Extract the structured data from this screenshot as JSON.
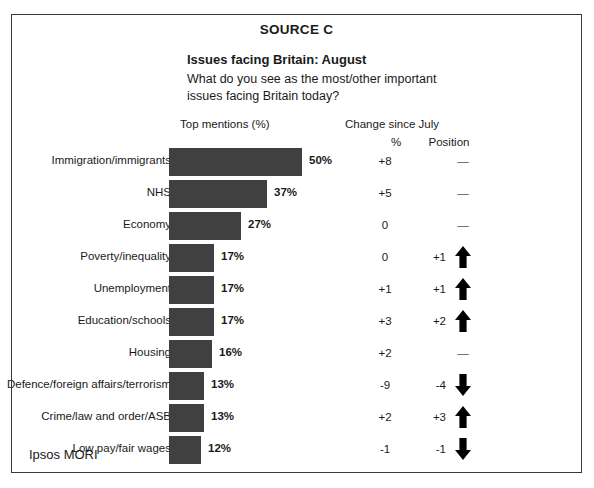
{
  "source_title": "SOURCE C",
  "chart_title": "Issues facing Britain: August",
  "chart_question": "What do you see as the most/other important issues facing Britain today?",
  "columns": {
    "bars_header": "Top mentions (%)",
    "change_group_header": "Change since July",
    "change_pct_header": "%",
    "change_position_header": "Position"
  },
  "footer": {
    "brand": "Ipsos MORI"
  },
  "colors": {
    "bar": "#404040",
    "frame": "#3a3a3a",
    "text": "#1a1a1a"
  },
  "no_change_symbol": "—",
  "chart_data": {
    "type": "bar",
    "orientation": "horizontal",
    "title": "Issues facing Britain: August",
    "subtitle": "What do you see as the most/other important issues facing Britain today?",
    "xlabel": "Top mentions (%)",
    "ylabel": "",
    "xlim": [
      0,
      50
    ],
    "grid": false,
    "legend": false,
    "categories": [
      "Immigration/immigrants",
      "NHS",
      "Economy",
      "Poverty/inequality",
      "Unemployment",
      "Education/schools",
      "Housing",
      "Defence/foreign affairs/terrorism",
      "Crime/law and order/ASB",
      "Low pay/fair wages"
    ],
    "values": [
      50,
      37,
      27,
      17,
      17,
      17,
      16,
      13,
      13,
      12
    ],
    "value_labels": [
      "50%",
      "37%",
      "27%",
      "17%",
      "17%",
      "17%",
      "16%",
      "13%",
      "13%",
      "12%"
    ],
    "change_pct": [
      "+8",
      "+5",
      "0",
      "0",
      "+1",
      "+3",
      "+2",
      "-9",
      "+2",
      "-1"
    ],
    "change_position": [
      "—",
      "—",
      "—",
      "+1",
      "+1",
      "+2",
      "—",
      "-4",
      "+3",
      "-1"
    ],
    "change_direction": [
      "none",
      "none",
      "none",
      "up",
      "up",
      "up",
      "none",
      "down",
      "up",
      "down"
    ]
  },
  "rows": [
    {
      "label": "Immigration/immigrants",
      "value": 50,
      "value_label": "50%",
      "change_pct": "+8",
      "change_position": "—",
      "direction": "none"
    },
    {
      "label": "NHS",
      "value": 37,
      "value_label": "37%",
      "change_pct": "+5",
      "change_position": "—",
      "direction": "none"
    },
    {
      "label": "Economy",
      "value": 27,
      "value_label": "27%",
      "change_pct": "0",
      "change_position": "—",
      "direction": "none"
    },
    {
      "label": "Poverty/inequality",
      "value": 17,
      "value_label": "17%",
      "change_pct": "0",
      "change_position": "+1",
      "direction": "up"
    },
    {
      "label": "Unemployment",
      "value": 17,
      "value_label": "17%",
      "change_pct": "+1",
      "change_position": "+1",
      "direction": "up"
    },
    {
      "label": "Education/schools",
      "value": 17,
      "value_label": "17%",
      "change_pct": "+3",
      "change_position": "+2",
      "direction": "up"
    },
    {
      "label": "Housing",
      "value": 16,
      "value_label": "16%",
      "change_pct": "+2",
      "change_position": "—",
      "direction": "none"
    },
    {
      "label": "Defence/foreign affairs/terrorism",
      "value": 13,
      "value_label": "13%",
      "change_pct": "-9",
      "change_position": "-4",
      "direction": "down"
    },
    {
      "label": "Crime/law and order/ASB",
      "value": 13,
      "value_label": "13%",
      "change_pct": "+2",
      "change_position": "+3",
      "direction": "up"
    },
    {
      "label": "Low pay/fair wages",
      "value": 12,
      "value_label": "12%",
      "change_pct": "-1",
      "change_position": "-1",
      "direction": "down"
    }
  ]
}
